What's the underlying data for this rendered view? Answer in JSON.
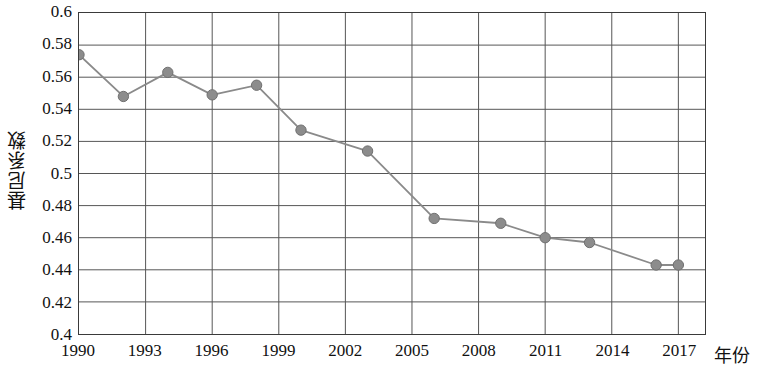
{
  "chart_data": {
    "type": "line",
    "title": "",
    "xlabel": "年份",
    "ylabel": "基尼系数",
    "xlim": [
      1990,
      2018.2
    ],
    "ylim": [
      0.4,
      0.6
    ],
    "grid": true,
    "legend": null,
    "x_tick_labels": [
      "1990",
      "1993",
      "1996",
      "1999",
      "2002",
      "2005",
      "2008",
      "2011",
      "2014",
      "2017"
    ],
    "x_tick_values": [
      1990,
      1993,
      1996,
      1999,
      2002,
      2005,
      2008,
      2011,
      2014,
      2017
    ],
    "y_tick_labels": [
      "0.6",
      "0.58",
      "0.56",
      "0.54",
      "0.52",
      "0.5",
      "0.48",
      "0.46",
      "0.44",
      "0.42",
      "0.4"
    ],
    "y_tick_values": [
      0.6,
      0.58,
      0.56,
      0.54,
      0.52,
      0.5,
      0.48,
      0.46,
      0.44,
      0.42,
      0.4
    ],
    "x": [
      1990,
      1992,
      1994,
      1996,
      1998,
      2000,
      2003,
      2006,
      2009,
      2011,
      2013,
      2016,
      2017
    ],
    "values": [
      0.574,
      0.548,
      0.563,
      0.549,
      0.555,
      0.527,
      0.514,
      0.472,
      0.469,
      0.46,
      0.457,
      0.443,
      0.443
    ],
    "series": [
      {
        "name": "基尼系数",
        "values": [
          0.574,
          0.548,
          0.563,
          0.549,
          0.555,
          0.527,
          0.514,
          0.472,
          0.469,
          0.46,
          0.457,
          0.443,
          0.443
        ]
      }
    ],
    "colors": {
      "line": "#8a8a8a",
      "marker": "#8c8c8c",
      "marker_edge": "#6f6f6f",
      "grid": "#555555",
      "axis": "#3a3a3a",
      "text": "#111111"
    },
    "marker_radius": 5.2,
    "line_width": 1.8
  }
}
